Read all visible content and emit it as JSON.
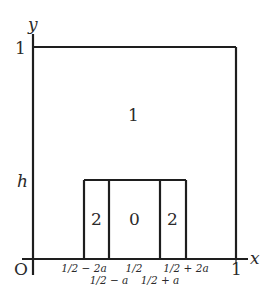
{
  "diagram": {
    "axes": {
      "origin_label": "O",
      "x_label": "x",
      "y_label": "y",
      "x_end_label": "1",
      "y_top_label": "1",
      "y_h_label": "h"
    },
    "regions": {
      "outer_label": "1",
      "left_strip_label": "2",
      "center_label": "0",
      "right_strip_label": "2"
    },
    "x_ticks_row1": {
      "left": "1/2 − 2a",
      "mid": "1/2",
      "right": "1/2 + 2a"
    },
    "x_ticks_row2": {
      "left": "1/2 − a",
      "right": "1/2 + a"
    },
    "colors": {
      "line": "#1e1e1e",
      "text": "#2a2a2a",
      "background": "#ffffff"
    }
  }
}
